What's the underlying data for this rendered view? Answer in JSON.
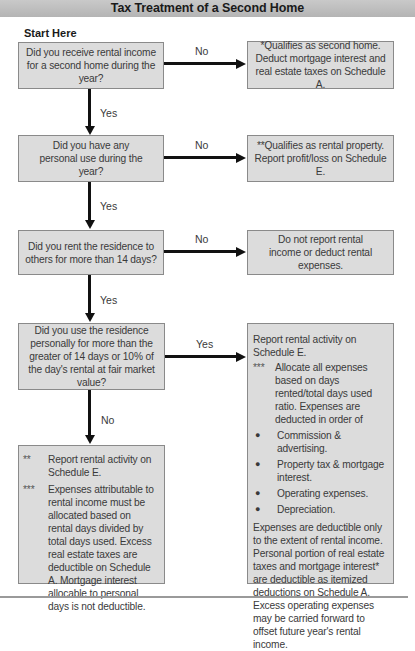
{
  "title": "Tax Treatment of a Second Home",
  "start_label": "Start Here",
  "questions": [
    {
      "text": "Did you receive rental income for a second home during the year?",
      "yes_label": "Yes",
      "no_label": "No",
      "no_result": "*Qualifies as second home. Deduct mortgage interest and real estate taxes on Schedule A."
    },
    {
      "text": "Did you have any personal use during the year?",
      "yes_label": "Yes",
      "no_label": "No",
      "no_result": "**Qualifies as rental property. Report profit/loss on Schedule E."
    },
    {
      "text": "Did you rent the residence to others for more than 14 days?",
      "yes_label": "Yes",
      "no_label": "No",
      "no_result": "Do not report rental income or deduct rental expenses."
    },
    {
      "text": "Did you use the residence personally for more than the greater of 14 days or 10% of the day's rental at fair market value?",
      "yes_label": "Yes",
      "no_label": "No"
    }
  ],
  "yes_result": {
    "heading": "Report rental activity on Schedule E.",
    "note_mark": "***",
    "note": "Allocate all expenses based on days rented/total days used ratio. Expenses are deducted in order of",
    "bullets": [
      "Commission & advertising.",
      "Property tax & mortgage interest.",
      "Operating expenses.",
      "Depreciation."
    ],
    "footer": "Expenses are deductible only to the extent of rental income. Personal portion of real estate taxes and mortgage interest* are deductible as itemized deductions on Schedule A. Excess operating expenses may be carried forward to offset future year's rental income."
  },
  "no_result": {
    "notes": [
      {
        "mark": "**",
        "text": "Report rental activity on Schedule E."
      },
      {
        "mark": "***",
        "text": "Expenses attributable to rental income must be allocated based on rental days divided by total days used. Excess real estate taxes are deductible on Schedule A. Mortgage interest allocable to personal days is not deductible."
      }
    ]
  },
  "colors": {
    "box_fill": "#dcdcdc",
    "box_border": "#8a8a8a",
    "arrow": "#111111",
    "title_bar": "#bdbdbd"
  }
}
